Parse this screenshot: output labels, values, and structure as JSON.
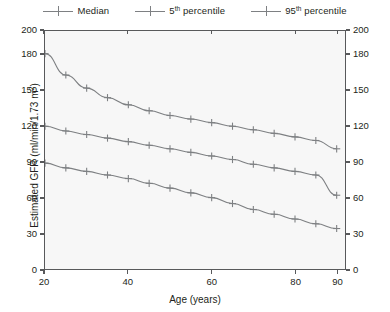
{
  "legend": {
    "position": "top-center",
    "entries": [
      {
        "label_plain": "Median",
        "label_main": "Median",
        "sup": "",
        "label_tail": "",
        "key": "line-cross-marker",
        "color": "#7e8083"
      },
      {
        "label_plain": "5th percentile",
        "label_main": "5",
        "sup": "th",
        "label_tail": " percentile",
        "key": "line-cross-marker",
        "color": "#7e8083"
      },
      {
        "label_plain": "95th percentile",
        "label_main": "95",
        "sup": "th",
        "label_tail": " percentile",
        "key": "line-cross-marker",
        "color": "#7e8083"
      }
    ]
  },
  "axes": {
    "x_title": "Age (years)",
    "y_title_main": "Estimated GFR (ml/min/1.73 m",
    "y_title_sup": "2",
    "y_title_tail": ")",
    "y_title_plain": "Estimated GFR (ml/min/1.73 m2)",
    "x_ticks": [
      20,
      40,
      60,
      80,
      90
    ],
    "y_ticks": [
      0,
      30,
      60,
      90,
      120,
      150,
      180,
      200
    ],
    "x_tick_labels": [
      "20",
      "40",
      "60",
      "80",
      "90"
    ],
    "y_tick_labels": [
      "0",
      "30",
      "60",
      "90",
      "120",
      "150",
      "180",
      "200"
    ],
    "x_range": [
      20,
      92
    ],
    "y_range": [
      0,
      200
    ],
    "grid": false,
    "left_axis": true,
    "right_axis": true
  },
  "chart_data": {
    "type": "line",
    "title": "",
    "subtitle": "",
    "xlabel": "Age (years)",
    "ylabel": "Estimated GFR (ml/min/1.73 m2)",
    "xlim": [
      20,
      92
    ],
    "ylim": [
      0,
      200
    ],
    "grid": false,
    "legend_position": "top-center",
    "marker": "plus",
    "line_color": "#7e8083",
    "x": [
      20,
      25,
      30,
      35,
      40,
      45,
      50,
      55,
      60,
      65,
      70,
      75,
      80,
      85,
      90
    ],
    "series": [
      {
        "name": "95th percentile",
        "values": [
          181,
          163,
          152,
          144,
          138,
          133,
          129,
          126,
          123,
          120,
          117,
          114,
          111,
          108,
          101
        ]
      },
      {
        "name": "Median",
        "values": [
          120,
          116,
          113,
          110,
          107,
          104,
          101,
          98,
          95,
          92,
          88,
          85,
          82,
          79,
          62
        ]
      },
      {
        "name": "5th percentile",
        "values": [
          89,
          85,
          82,
          79,
          76,
          72,
          68,
          64,
          60,
          55,
          50,
          46,
          42,
          38,
          34
        ]
      }
    ]
  }
}
